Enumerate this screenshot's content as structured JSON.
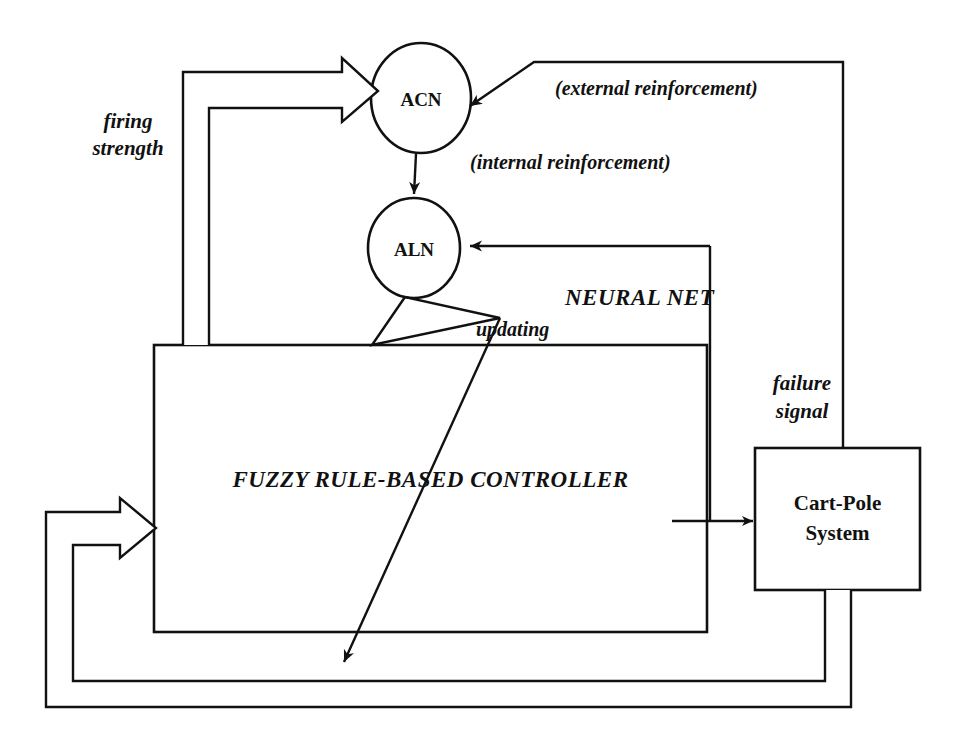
{
  "diagram": {
    "background_color": "#ffffff",
    "line_color": "#111111",
    "nodes": {
      "acn": {
        "label": "ACN",
        "shape": "ellipse",
        "cx": 421,
        "cy": 98,
        "rx": 50,
        "ry": 55
      },
      "aln": {
        "label": "ALN",
        "shape": "ellipse",
        "cx": 414,
        "cy": 248,
        "rx": 46,
        "ry": 50
      },
      "controller": {
        "label": "FUZZY RULE-BASED CONTROLLER",
        "shape": "rect",
        "x": 154,
        "y": 345,
        "w": 553,
        "h": 287
      },
      "plant": {
        "label_line1": "Cart-Pole",
        "label_line2": "System",
        "shape": "rect",
        "x": 755,
        "y": 448,
        "w": 165,
        "h": 142
      }
    },
    "labels": {
      "external_reinforcement": "(external reinforcement)",
      "internal_reinforcement": "(internal reinforcement)",
      "firing_strength_line1": "firing",
      "firing_strength_line2": "strength",
      "neural_net": "NEURAL NET",
      "updating": "updating",
      "failure_signal_line1": "failure",
      "failure_signal_line2": "signal"
    },
    "edges": [
      {
        "name": "external-reinforcement-edge",
        "from": "plant",
        "to": "acn",
        "style": "thin-arrow"
      },
      {
        "name": "internal-reinforcement-edge",
        "from": "acn",
        "to": "aln",
        "style": "thin-arrow"
      },
      {
        "name": "state-to-aln-edge",
        "from": "plant-feedback",
        "to": "aln",
        "style": "thin-arrow"
      },
      {
        "name": "updating-edge",
        "from": "aln",
        "to": "controller",
        "style": "thin-arrow"
      },
      {
        "name": "updating-long-edge",
        "from": "aln",
        "to": "controller-bottom",
        "style": "thin-arrow"
      },
      {
        "name": "firing-strength-edge",
        "from": "controller",
        "to": "acn",
        "style": "hollow-block-arrow"
      },
      {
        "name": "control-action-edge",
        "from": "controller",
        "to": "plant",
        "style": "thin-arrow"
      },
      {
        "name": "state-feedback-edge",
        "from": "plant",
        "to": "controller",
        "style": "hollow-block-arrow"
      }
    ]
  }
}
